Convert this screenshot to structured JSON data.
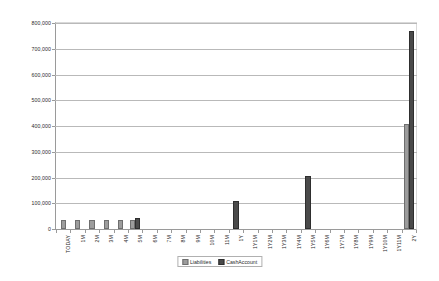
{
  "chart_data": {
    "type": "bar",
    "title": "",
    "xlabel": "",
    "ylabel": "",
    "ylim": [
      0,
      800000
    ],
    "yticks": [
      0,
      100000,
      200000,
      300000,
      400000,
      500000,
      600000,
      700000,
      800000
    ],
    "ytick_labels": [
      "0",
      "100,000",
      "200,000",
      "300,000",
      "400,000",
      "500,000",
      "600,000",
      "700,000",
      "800,000"
    ],
    "grid": true,
    "legend_position": "bottom",
    "categories": [
      "TODAY",
      "1M",
      "2M",
      "3M",
      "4M",
      "5M",
      "6M",
      "7M",
      "8M",
      "9M",
      "10M",
      "11M",
      "1Y",
      "1Y1M",
      "1Y2M",
      "1Y3M",
      "1Y4M",
      "1Y5M",
      "1Y6M",
      "1Y7M",
      "1Y8M",
      "1Y9M",
      "1Y10M",
      "1Y11M",
      "2Y"
    ],
    "series": [
      {
        "name": "Liabilities",
        "color": "#9c9c9c",
        "values": [
          28000,
          28000,
          28000,
          28000,
          28000,
          28000,
          0,
          0,
          0,
          0,
          0,
          0,
          0,
          0,
          0,
          0,
          0,
          0,
          0,
          0,
          0,
          0,
          0,
          0,
          400000
        ]
      },
      {
        "name": "CashAccount",
        "color": "#4a4a4a",
        "values": [
          0,
          0,
          0,
          0,
          0,
          36000,
          0,
          0,
          0,
          0,
          0,
          0,
          100000,
          0,
          0,
          0,
          0,
          200000,
          0,
          0,
          0,
          0,
          0,
          0,
          760000
        ]
      }
    ]
  }
}
